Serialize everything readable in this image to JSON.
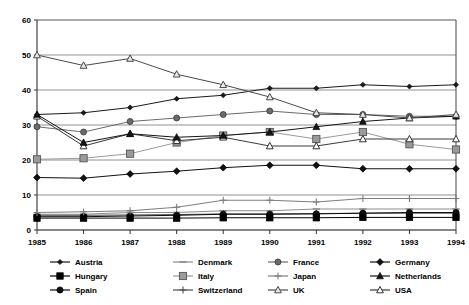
{
  "chart_data": {
    "type": "line",
    "title": "",
    "subtitle": "",
    "xlabel": "",
    "ylabel": "",
    "grid": true,
    "legend_position": "bottom",
    "xlim": [
      1985,
      1994
    ],
    "ylim": [
      0,
      60
    ],
    "ytick_values": [
      0,
      10,
      20,
      30,
      40,
      50,
      60
    ],
    "ytick_labels": [
      "0",
      "10",
      "20",
      "30",
      "40",
      "50",
      "60"
    ],
    "categories": [
      1985,
      1986,
      1987,
      1988,
      1989,
      1990,
      1991,
      1992,
      1993,
      1994
    ],
    "xtick_labels": [
      "1985",
      "1986",
      "1987",
      "1988",
      "1989",
      "1990",
      "1991",
      "1992",
      "1993",
      "1994"
    ],
    "series": [
      {
        "name": "Austria",
        "marker": "diamond-small",
        "color": "#1a1a1a",
        "values": [
          33,
          33.5,
          35,
          37.5,
          38.5,
          40.5,
          40.5,
          41.5,
          41,
          41.5
        ]
      },
      {
        "name": "Denmark",
        "marker": "dash",
        "color": "#8c8c8c",
        "values": [
          4.5,
          4.5,
          5,
          5,
          5.5,
          5.5,
          6,
          6,
          6,
          6
        ]
      },
      {
        "name": "France",
        "marker": "circle-gray",
        "color": "#6b6b6b",
        "values": [
          29.5,
          28,
          31,
          32,
          33,
          34,
          33,
          33,
          32.5,
          32.5
        ]
      },
      {
        "name": "Germany",
        "marker": "diamond",
        "color": "#111111",
        "values": [
          15,
          14.8,
          16,
          16.8,
          17.8,
          18.5,
          18.5,
          17.5,
          17.5,
          17.5
        ]
      },
      {
        "name": "Hungary",
        "marker": "square-black",
        "color": "#000000",
        "values": [
          3.4,
          3.4,
          3.4,
          3.4,
          3.5,
          3.5,
          3.5,
          3.6,
          3.6,
          3.6
        ]
      },
      {
        "name": "Italy",
        "marker": "square-gray",
        "color": "#9a9a9a",
        "values": [
          20.2,
          20.5,
          21.8,
          25,
          27,
          28,
          26,
          28,
          24.5,
          23
        ]
      },
      {
        "name": "Japan",
        "marker": "plus-gray",
        "color": "#7d7d7d",
        "values": [
          5,
          5.2,
          5.5,
          6.5,
          8.5,
          8.5,
          8,
          9,
          9,
          9
        ]
      },
      {
        "name": "Netherlands",
        "marker": "triangle-filled",
        "color": "#151515",
        "values": [
          33,
          25,
          27.5,
          26.5,
          27,
          28,
          29.5,
          31,
          32,
          32.5
        ]
      },
      {
        "name": "Spain",
        "marker": "circle-black",
        "color": "#0d0d0d",
        "values": [
          3.8,
          3.8,
          4,
          4.2,
          4.5,
          4.5,
          4.6,
          4.8,
          5,
          5
        ]
      },
      {
        "name": "Switzerland",
        "marker": "plus",
        "color": "#4d4d4d",
        "values": [
          4.2,
          4.2,
          4.3,
          4.4,
          4.6,
          4.6,
          4.7,
          4.8,
          4.8,
          4.8
        ]
      },
      {
        "name": "UK",
        "marker": "triangle-open-gray",
        "color": "#4a4a4a",
        "values": [
          50,
          47,
          49,
          44.5,
          41.5,
          38,
          33.5,
          33,
          32,
          33
        ]
      },
      {
        "name": "USA",
        "marker": "triangle-open",
        "color": "#3a3a3a",
        "values": [
          32.5,
          24,
          27.5,
          25.5,
          26.5,
          24,
          24,
          26,
          26,
          26
        ]
      }
    ]
  },
  "legend": {
    "rows": [
      [
        {
          "label": "Austria",
          "key": "Austria"
        },
        {
          "label": "Denmark",
          "key": "Denmark"
        },
        {
          "label": "France",
          "key": "France"
        },
        {
          "label": "Germany",
          "key": "Germany"
        }
      ],
      [
        {
          "label": "Hungary",
          "key": "Hungary"
        },
        {
          "label": "Italy",
          "key": "Italy"
        },
        {
          "label": "Japan",
          "key": "Japan"
        },
        {
          "label": "Netherlands",
          "key": "Netherlands"
        }
      ],
      [
        {
          "label": "Spain",
          "key": "Spain"
        },
        {
          "label": "Switzerland",
          "key": "Switzerland"
        },
        {
          "label": "UK",
          "key": "UK"
        },
        {
          "label": "USA",
          "key": "USA"
        }
      ]
    ]
  }
}
